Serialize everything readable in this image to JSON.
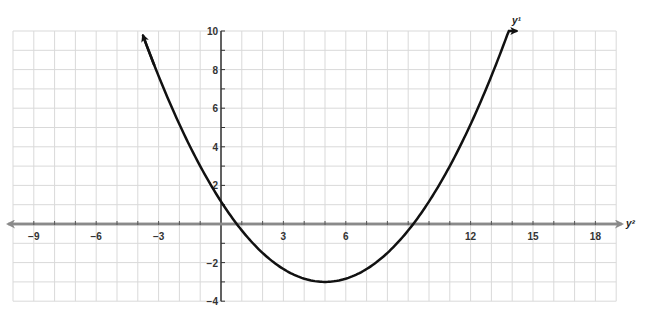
{
  "chart_data": {
    "type": "line",
    "title": "",
    "xlabel": "y²",
    "ylabel": "y¹",
    "xlim": [
      -10,
      19
    ],
    "ylim": [
      -4,
      10
    ],
    "grid": true,
    "x_ticks": [
      -9,
      -6,
      -3,
      3,
      6,
      9,
      12,
      15,
      18
    ],
    "x_tick_labels": [
      "−9",
      "−6",
      "−3",
      "3",
      "6",
      "",
      "12",
      "15",
      "18"
    ],
    "y_ticks": [
      10,
      8,
      6,
      4,
      2,
      -2,
      -4
    ],
    "y_tick_labels": [
      "10",
      "8",
      "6",
      "4",
      "2",
      "−2",
      "−4"
    ],
    "series": [
      {
        "name": "parabola",
        "equation": "y = (1/6)(x - 5)^2 - 3",
        "vertex": [
          5,
          -3
        ],
        "roots": [
          0.76,
          9.24
        ],
        "y_intercept": 1.17,
        "x": [
          -3.75,
          -3,
          -2,
          -1,
          0,
          1,
          2,
          3,
          4,
          5,
          6,
          7,
          8,
          9,
          10,
          11,
          12,
          13,
          14,
          14.2
        ],
        "y": [
          9.76,
          7.67,
          5.17,
          3.0,
          1.17,
          -0.33,
          -1.5,
          -2.33,
          -2.83,
          -3.0,
          -2.83,
          -2.33,
          -1.5,
          -0.33,
          1.17,
          3.0,
          5.17,
          7.67,
          10.5,
          11.1
        ],
        "color": "#111111",
        "arrows": "both ends"
      }
    ]
  },
  "labels": {
    "x_axis_name": "y²",
    "y_axis_name": "y¹"
  },
  "colors": {
    "grid": "#d9d9d9",
    "x_axis": "#8a8a8a",
    "y_axis": "#333333",
    "curve": "#111111"
  }
}
